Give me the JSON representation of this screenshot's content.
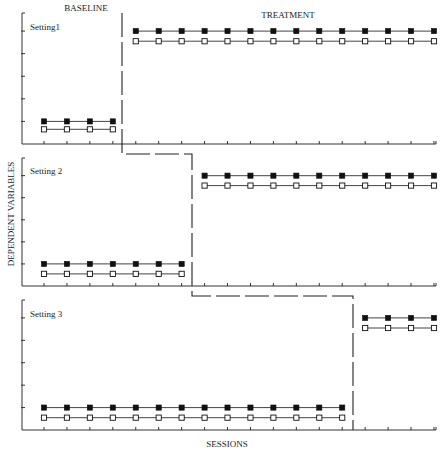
{
  "chart_data": {
    "type": "line",
    "title": "",
    "design": "multiple-baseline across settings",
    "xlabel": "SESSIONS",
    "ylabel": "DEPENDENT VARIABLES",
    "phase_labels": [
      "BASELINE",
      "TREATMENT"
    ],
    "sessions": [
      1,
      2,
      3,
      4,
      5,
      6,
      7,
      8,
      9,
      10,
      11,
      12,
      13,
      14,
      15,
      16,
      17,
      18
    ],
    "ylim": [
      0,
      5.8
    ],
    "yticks": [
      1,
      2,
      3,
      4,
      5
    ],
    "grid": false,
    "legend": "none (filled square series and open square series)",
    "panels": [
      {
        "label": "Setting1",
        "baseline_sessions": 4,
        "series": [
          {
            "name": "filled",
            "marker": "filled-square",
            "values": [
              1,
              1,
              1,
              1,
              5,
              5,
              5,
              5,
              5,
              5,
              5,
              5,
              5,
              5,
              5,
              5,
              5,
              5
            ]
          },
          {
            "name": "open",
            "marker": "open-square",
            "values": [
              0.65,
              0.65,
              0.65,
              0.65,
              4.55,
              4.55,
              4.55,
              4.55,
              4.55,
              4.55,
              4.55,
              4.55,
              4.55,
              4.55,
              4.55,
              4.55,
              4.55,
              4.55
            ]
          }
        ]
      },
      {
        "label": "Setting 2",
        "baseline_sessions": 7,
        "series": [
          {
            "name": "filled",
            "marker": "filled-square",
            "values": [
              1,
              1,
              1,
              1,
              1,
              1,
              1,
              5,
              5,
              5,
              5,
              5,
              5,
              5,
              5,
              5,
              5,
              5
            ]
          },
          {
            "name": "open",
            "marker": "open-square",
            "values": [
              0.55,
              0.55,
              0.55,
              0.55,
              0.55,
              0.55,
              0.55,
              4.55,
              4.55,
              4.55,
              4.55,
              4.55,
              4.55,
              4.55,
              4.55,
              4.55,
              4.55,
              4.55
            ]
          }
        ]
      },
      {
        "label": "Setting 3",
        "baseline_sessions": 14,
        "series": [
          {
            "name": "filled",
            "marker": "filled-square",
            "values": [
              1,
              1,
              1,
              1,
              1,
              1,
              1,
              1,
              1,
              1,
              1,
              1,
              1,
              1,
              5,
              5,
              5,
              5
            ]
          },
          {
            "name": "open",
            "marker": "open-square",
            "values": [
              0.55,
              0.55,
              0.55,
              0.55,
              0.55,
              0.55,
              0.55,
              0.55,
              0.55,
              0.55,
              0.55,
              0.55,
              0.55,
              0.55,
              4.55,
              4.55,
              4.55,
              4.55
            ]
          }
        ]
      }
    ]
  },
  "layout": {
    "x0": 44,
    "dx": 22.94,
    "axis_left": 22,
    "axis_right": 436,
    "panels_px": [
      {
        "top": 13,
        "bottom": 144,
        "label_y": 30,
        "phase_x": 122
      },
      {
        "top": 158,
        "bottom": 286,
        "label_y": 174,
        "phase_x": 192
      },
      {
        "top": 300,
        "bottom": 430,
        "label_y": 317,
        "phase_x": 353
      }
    ],
    "colors": {
      "axis": "#333333",
      "line": "#444444",
      "marker": "#111111",
      "phase": "#222222"
    }
  }
}
